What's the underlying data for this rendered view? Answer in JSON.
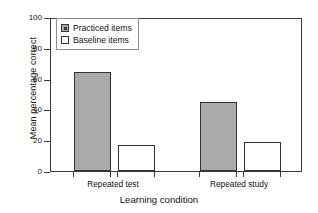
{
  "chart_data": {
    "type": "bar",
    "title": "",
    "xlabel": "Learning condition",
    "ylabel": "Mean percentage correct",
    "categories": [
      "Repeated test",
      "Repeated study"
    ],
    "series": [
      {
        "name": "Practiced items",
        "values": [
          64,
          45
        ],
        "color": "#aaaaaa"
      },
      {
        "name": "Baseline items",
        "values": [
          17,
          19
        ],
        "color": "#ffffff"
      }
    ],
    "ylim": [
      0,
      100
    ],
    "yticks": [
      0,
      20,
      40,
      60,
      80,
      100
    ],
    "ytick_labels": [
      "0",
      "20",
      "40",
      "60",
      "80",
      "100"
    ],
    "grid": false,
    "legend_position": "top-left",
    "legend_entries": [
      "Practiced items",
      "Baseline items"
    ]
  },
  "axes": {
    "y_title": "Mean percentage correct",
    "x_title": "Learning condition",
    "y_ticks": [
      "100",
      "80",
      "60",
      "40",
      "20",
      "0"
    ],
    "x_ticks": [
      "Repeated test",
      "Repeated study"
    ]
  },
  "legend": {
    "items": [
      {
        "label": "Practiced items",
        "swatch": "filled-gray-square-icon"
      },
      {
        "label": "Baseline items",
        "swatch": "empty-white-square-icon"
      }
    ]
  }
}
